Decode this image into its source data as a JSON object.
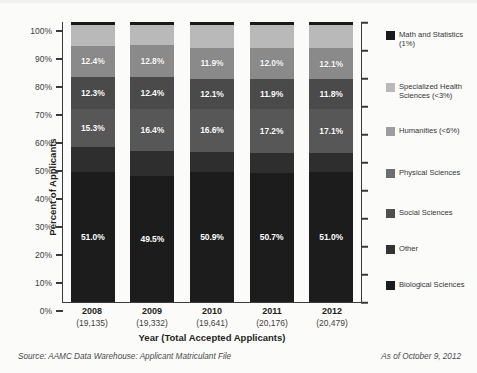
{
  "chart_data": {
    "type": "bar",
    "subtype": "stacked-100-percent",
    "title": "",
    "xlabel": "Year (Total Accepted Applicants)",
    "ylabel": "Percent of Applicants",
    "ylim": [
      0,
      100
    ],
    "ytick_labels": [
      "100%",
      "90%",
      "80%",
      "70%",
      "60%",
      "50%",
      "40%",
      "30%",
      "20%",
      "10%",
      "0%"
    ],
    "ytick_values": [
      100,
      90,
      80,
      70,
      60,
      50,
      40,
      30,
      20,
      10,
      0
    ],
    "grid": false,
    "legend_position": "right",
    "categories": [
      "2008",
      "2009",
      "2010",
      "2011",
      "2012"
    ],
    "category_sublabels": [
      "(19,135)",
      "(19,332)",
      "(19,641)",
      "(20,176)",
      "(20,479)"
    ],
    "series": [
      {
        "name": "Biological Sciences",
        "color": "#1c1c1c",
        "values": [
          51.0,
          49.5,
          50.9,
          50.7,
          51.0
        ],
        "labels": [
          "51.0%",
          "49.5%",
          "50.9%",
          "50.7%",
          "51.0%"
        ],
        "show_labels": true
      },
      {
        "name": "Other",
        "color": "#2e2e2e",
        "values": [
          9.7,
          10.0,
          8.2,
          8.0,
          7.7
        ],
        "labels": [
          "",
          "",
          "",
          "",
          ""
        ],
        "show_labels": false
      },
      {
        "name": "Social Sciences",
        "color": "#575757",
        "values": [
          15.3,
          16.4,
          16.6,
          17.2,
          17.1
        ],
        "labels": [
          "15.3%",
          "16.4%",
          "16.6%",
          "17.2%",
          "17.1%"
        ],
        "show_labels": true
      },
      {
        "name": "Physical Sciences",
        "color": "#4a4a4a",
        "values": [
          12.3,
          12.4,
          12.1,
          11.9,
          11.8
        ],
        "labels": [
          "12.3%",
          "12.4%",
          "12.1%",
          "11.9%",
          "11.8%"
        ],
        "show_labels": true
      },
      {
        "name": "Humanities (<6%)",
        "color": "#8a8a8a",
        "values": [
          12.4,
          12.8,
          11.9,
          12.0,
          12.1
        ],
        "labels": [
          "12.4%",
          "12.8%",
          "11.9%",
          "12.0%",
          "12.1%"
        ],
        "show_labels": true
      },
      {
        "name": "Specialized Health Sciences (<3%)",
        "color": "#b9b9b9",
        "values": [
          8.3,
          7.9,
          9.3,
          9.2,
          9.3
        ],
        "labels": [
          "",
          "",
          "",
          "",
          ""
        ],
        "show_labels": false
      },
      {
        "name": "Math and Statistics (1%)",
        "color": "#1a1a1a",
        "values": [
          1.0,
          1.0,
          1.0,
          1.0,
          1.0
        ],
        "labels": [
          "",
          "",
          "",
          "",
          ""
        ],
        "show_labels": false
      }
    ]
  },
  "legend": {
    "items": [
      {
        "label": "Math and Statistics (1%)",
        "color": "#1a1a1a"
      },
      {
        "label": "Specialized Health Sciences (<3%)",
        "color": "#b9b9b9"
      },
      {
        "label": "Humanities (<6%)",
        "color": "#9d9d9d"
      },
      {
        "label": "Physical Sciences",
        "color": "#6e6e6e"
      },
      {
        "label": "Social Sciences",
        "color": "#4f4f4f"
      },
      {
        "label": "Other",
        "color": "#333333"
      },
      {
        "label": "Biological Sciences",
        "color": "#1c1c1c"
      }
    ]
  },
  "footer": {
    "source": "Source: AAMC Data Warehouse: Applicant Matriculant File",
    "as_of": "As of October 9, 2012"
  }
}
